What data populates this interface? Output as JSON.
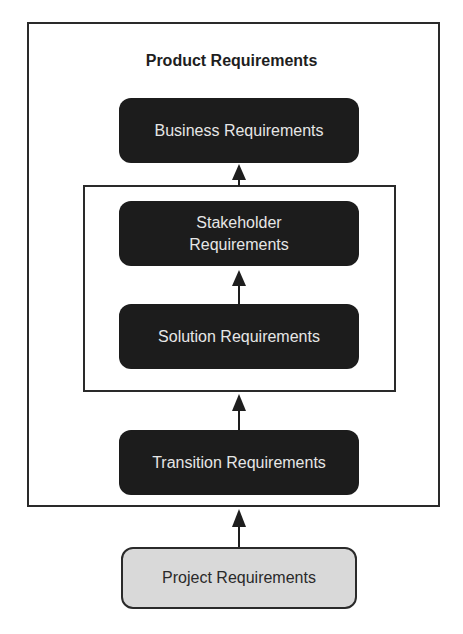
{
  "diagram": {
    "title": "Product Requirements",
    "nodes": [
      {
        "id": "business",
        "label": "Business Requirements",
        "style": "dark"
      },
      {
        "id": "stakeholder",
        "label": "Stakeholder Requirements",
        "style": "dark"
      },
      {
        "id": "solution",
        "label": "Solution Requirements",
        "style": "dark"
      },
      {
        "id": "transition",
        "label": "Transition Requirements",
        "style": "dark"
      },
      {
        "id": "project",
        "label": "Project Requirements",
        "style": "light"
      }
    ],
    "edges": [
      {
        "from": "project",
        "to": "transition"
      },
      {
        "from": "transition",
        "to": "inner-group"
      },
      {
        "from": "solution",
        "to": "stakeholder"
      },
      {
        "from": "inner-group",
        "to": "business"
      }
    ],
    "groups": [
      {
        "id": "outer-group",
        "label": "Product Requirements",
        "contains": [
          "business",
          "stakeholder",
          "solution",
          "transition"
        ]
      },
      {
        "id": "inner-group",
        "label": "",
        "contains": [
          "stakeholder",
          "solution"
        ]
      }
    ],
    "colors": {
      "dark_fill": "#1c1c1c",
      "dark_text": "#e6e6e6",
      "light_fill": "#d9d9d9",
      "border": "#2a2a2a"
    }
  },
  "labels": {
    "business": "Business Requirements",
    "stakeholder_line1": "Stakeholder",
    "stakeholder_line2": "Requirements",
    "solution": "Solution Requirements",
    "transition": "Transition Requirements",
    "project": "Project Requirements"
  }
}
